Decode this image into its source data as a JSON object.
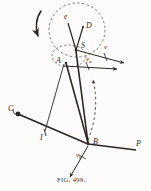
{
  "figure": {
    "caption": "FIG. 499.",
    "ink_color": "#2b2622",
    "paper_color": "#fdfcfa",
    "width": 151,
    "height": 191
  },
  "points": [
    {
      "id": "e",
      "label": "e",
      "x": 67,
      "y": 18
    },
    {
      "id": "D",
      "label": "D",
      "x": 86,
      "y": 28
    },
    {
      "id": "S",
      "label": "S",
      "x": 81,
      "y": 47
    },
    {
      "id": "A",
      "label": "A",
      "x": 62,
      "y": 61
    },
    {
      "id": "C",
      "label": "C",
      "x": 11,
      "y": 111
    },
    {
      "id": "I",
      "label": "I",
      "x": 42,
      "y": 136
    },
    {
      "id": "B",
      "label": "B",
      "x": 90,
      "y": 144
    },
    {
      "id": "P",
      "label": "P",
      "x": 139,
      "y": 146
    }
  ],
  "vectors": [
    {
      "id": "v",
      "label": "v",
      "sub": "",
      "x": 107,
      "y": 49
    },
    {
      "id": "va",
      "label": "v",
      "sub": "a",
      "x": 90,
      "y": 62
    },
    {
      "id": "vb",
      "label": "v",
      "sub": "b",
      "x": 80,
      "y": 157
    }
  ],
  "annotations": {
    "rotation_arrow": "curved-rotation-arrow",
    "big_dashed_circle": "dashed-path-of-D",
    "small_dashed_circle": "dashed-path-of-A",
    "dashed_arc": "dashed-arc-to-B"
  }
}
